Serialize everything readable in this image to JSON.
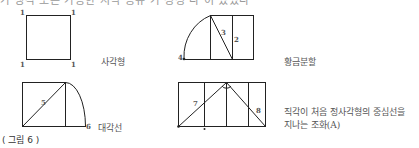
{
  "top_cut_text": "가 생각 또는 가능한 지식 공유 가 정성 다 이 있었다 ",
  "figures": [
    {
      "id": "square",
      "label": "사각형",
      "corner_marks": [
        "1",
        "1",
        "1",
        "1"
      ]
    },
    {
      "id": "golden-section",
      "label": "황금분할",
      "marks": [
        "4",
        "3",
        "2"
      ]
    },
    {
      "id": "diagonal",
      "label": "대각선",
      "marks": [
        "5",
        "6"
      ]
    },
    {
      "id": "harmony-a",
      "label_line1": "직각이 처음 정사각형의 중심선을",
      "label_line2": "지나는 조화(A)",
      "marks": [
        "7",
        "8"
      ]
    }
  ],
  "caption": "( 그림 6 )"
}
